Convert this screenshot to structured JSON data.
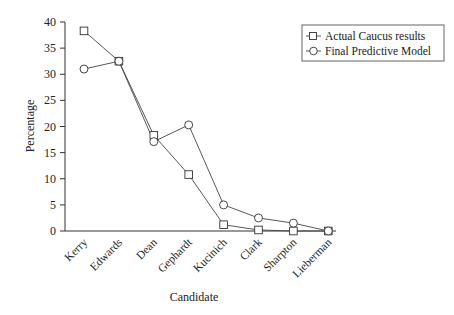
{
  "chart_data": {
    "type": "line",
    "title": "",
    "xlabel": "Candidate",
    "ylabel": "Percentage",
    "categories": [
      "Kerry",
      "Edwards",
      "Dean",
      "Gephardt",
      "Kucinich",
      "Clark",
      "Sharpton",
      "Lieberman"
    ],
    "ylim": [
      0,
      40
    ],
    "yticks": [
      0,
      5,
      10,
      15,
      20,
      25,
      30,
      35,
      40
    ],
    "grid": false,
    "legend_position": "top-right",
    "series": [
      {
        "name": "Actual Caucus results",
        "marker": "square",
        "values": [
          38.3,
          32.5,
          18.3,
          10.8,
          1.2,
          0.2,
          0.0,
          0.0
        ]
      },
      {
        "name": "Final Predictive Model",
        "marker": "circle",
        "values": [
          31.0,
          32.5,
          17.1,
          20.3,
          5.0,
          2.5,
          1.5,
          0.0
        ]
      }
    ]
  }
}
